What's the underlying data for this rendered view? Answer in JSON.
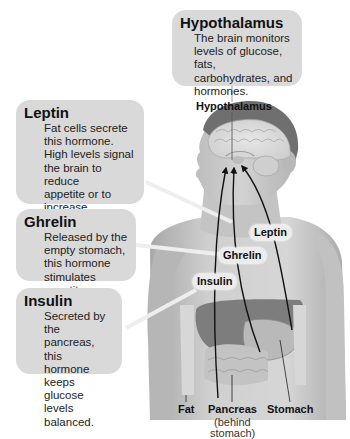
{
  "callouts": {
    "hypothalamus": {
      "title": "Hypothalamus",
      "lines": [
        "The brain monitors",
        "levels of glucose, fats,",
        "carbohydrates, and",
        "hormones."
      ]
    },
    "leptin": {
      "title": "Leptin",
      "lines": [
        "Fat cells secrete",
        "this hormone.",
        "High levels signal",
        "the brain to reduce",
        "appetite or to",
        "increase metabolism."
      ]
    },
    "ghrelin": {
      "title": "Ghrelin",
      "lines": [
        "Released by the",
        "empty stomach,",
        "this hormone",
        "stimulates appetite."
      ]
    },
    "insulin": {
      "title": "Insulin",
      "lines": [
        "Secreted by the",
        "pancreas, this",
        "hormone keeps",
        "glucose levels",
        "balanced."
      ]
    }
  },
  "body_labels": {
    "hypothalamus": "Hypothalamus",
    "leptin": "Leptin",
    "ghrelin": "Ghrelin",
    "insulin": "Insulin"
  },
  "organ_labels": {
    "fat": "Fat",
    "pancreas": "Pancreas",
    "pancreas_sub_1": "(behind",
    "pancreas_sub_2": "stomach)",
    "stomach": "Stomach"
  },
  "colors": {
    "callout_bg": "#d9d9d9",
    "pill_bg": "#ececec",
    "skin": "#c9c9c9",
    "arrow": "#111111"
  }
}
